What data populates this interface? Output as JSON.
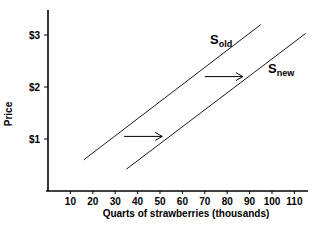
{
  "chart_data": {
    "type": "line",
    "title": "",
    "xlabel": "Quarts of strawberries (thousands)",
    "ylabel": "Price",
    "xlim": [
      0,
      115
    ],
    "ylim": [
      0,
      3.5
    ],
    "x_ticks": [
      10,
      20,
      30,
      40,
      50,
      60,
      70,
      80,
      90,
      100,
      110
    ],
    "y_ticks": [
      {
        "value": 1,
        "label": "$1"
      },
      {
        "value": 2,
        "label": "$2"
      },
      {
        "value": 3,
        "label": "$3"
      }
    ],
    "grid": false,
    "series": [
      {
        "name": "S_old",
        "label_main": "S",
        "label_sub": "old",
        "points": [
          [
            16,
            0.6
          ],
          [
            95,
            3.2
          ]
        ]
      },
      {
        "name": "S_new",
        "label_main": "S",
        "label_sub": "new",
        "points": [
          [
            35,
            0.42
          ],
          [
            115,
            3.03
          ]
        ]
      }
    ],
    "annotations": [
      {
        "type": "arrow",
        "from": [
          34,
          1.05
        ],
        "to": [
          51,
          1.05
        ],
        "meaning": "rightward shift of supply"
      },
      {
        "type": "arrow",
        "from": [
          70,
          2.2
        ],
        "to": [
          87,
          2.2
        ],
        "meaning": "rightward shift of supply"
      }
    ]
  }
}
